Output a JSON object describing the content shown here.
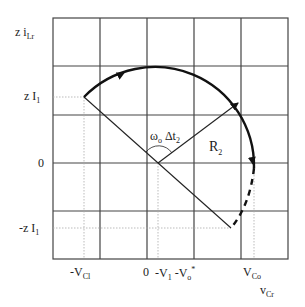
{
  "diagram": {
    "y_axis_label": {
      "main": "z i",
      "sub": "Lr"
    },
    "x_axis_label": {
      "main": "v",
      "sub": "Cr"
    },
    "y_ticks": [
      {
        "main": "z I",
        "sub": "1"
      },
      {
        "main": "0",
        "sub": ""
      },
      {
        "main": "-z I",
        "sub": "1"
      }
    ],
    "x_ticks": [
      {
        "main": "-V",
        "sub": "Cl"
      },
      {
        "main": "0",
        "sub": ""
      },
      {
        "main": "-V",
        "sub": "1",
        "main2": " -V",
        "sub2": "o",
        "sup2": "*"
      },
      {
        "main": "V",
        "sub": "Co"
      }
    ],
    "angle_label": {
      "main": "ω",
      "sub": "o",
      "main2": " Δt",
      "sub2": "2"
    },
    "radius_label": {
      "main": "R",
      "sub": "2"
    },
    "colors": {
      "grid": "#444444",
      "curve": "#111111",
      "guide": "#aaaaaa"
    }
  }
}
